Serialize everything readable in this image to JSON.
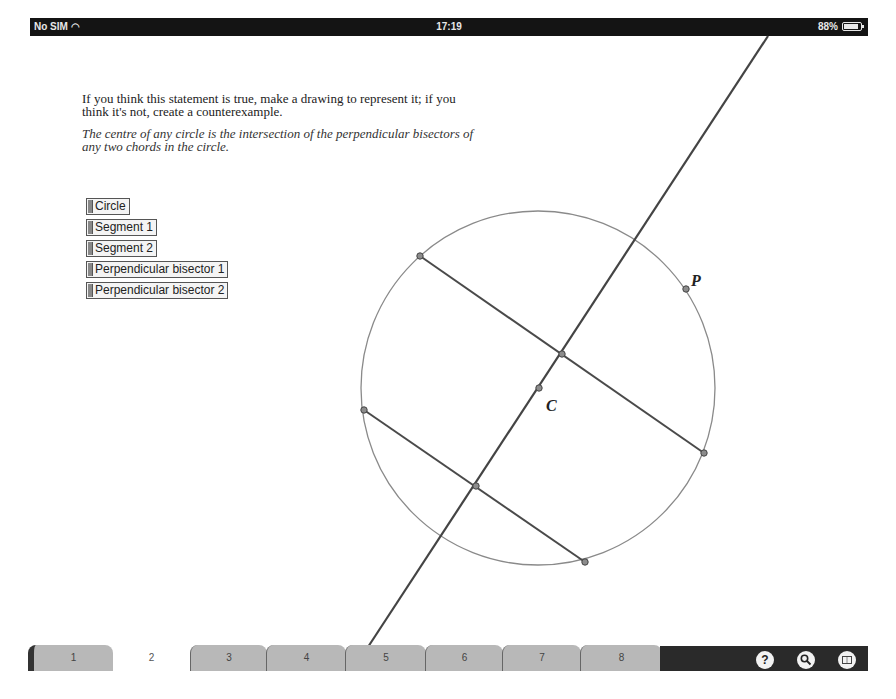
{
  "statusbar": {
    "carrier": "No SIM",
    "wifi_icon": "wifi-icon",
    "time": "17:19",
    "battery": "88%"
  },
  "instructions": {
    "prompt": "If you think this statement is true, make a drawing to represent it; if you think it's not, create a counterexample.",
    "statement": "The centre of any circle is the intersection of the perpendicular bisectors of any two chords in the circle."
  },
  "toggles": [
    {
      "label": "Circle"
    },
    {
      "label": "Segment 1"
    },
    {
      "label": "Segment 2"
    },
    {
      "label": "Perpendicular bisector 1"
    },
    {
      "label": "Perpendicular bisector 2"
    }
  ],
  "canvas": {
    "circle": {
      "cx": 538,
      "cy": 388,
      "r": 177,
      "color": "#888888"
    },
    "bisector_line": {
      "x1": 768,
      "y1": 36,
      "x2": 368,
      "y2": 647,
      "color": "#444444"
    },
    "segment1": {
      "x1": 420,
      "y1": 256,
      "x2": 704,
      "y2": 453
    },
    "segment2": {
      "x1": 364,
      "y1": 410,
      "x2": 585,
      "y2": 562
    },
    "points": [
      {
        "x": 420,
        "y": 256
      },
      {
        "x": 704,
        "y": 453
      },
      {
        "x": 364,
        "y": 410
      },
      {
        "x": 585,
        "y": 562
      },
      {
        "x": 562,
        "y": 354
      },
      {
        "x": 476,
        "y": 486
      },
      {
        "x": 686,
        "y": 289,
        "label": "P"
      },
      {
        "x": 539,
        "y": 388,
        "label": "C"
      }
    ],
    "label_P": "P",
    "label_C": "C"
  },
  "tabs": [
    {
      "label": "1",
      "active": false
    },
    {
      "label": "2",
      "active": true
    },
    {
      "label": "3",
      "active": false
    },
    {
      "label": "4",
      "active": false
    },
    {
      "label": "5",
      "active": false
    },
    {
      "label": "6",
      "active": false
    },
    {
      "label": "7",
      "active": false
    },
    {
      "label": "8",
      "active": false
    }
  ],
  "toolbar": {
    "help": "?",
    "search": "search-icon",
    "book": "book-icon"
  }
}
